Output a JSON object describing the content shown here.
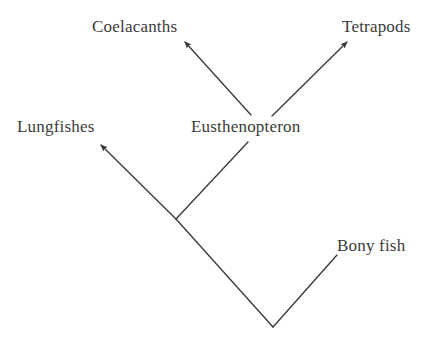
{
  "diagram": {
    "type": "cladogram",
    "background_color": "#ffffff",
    "line_color": "#3a3a3a",
    "text_color": "#3b3b3b",
    "labels": {
      "coelacanths": "Coelacanths",
      "tetrapods": "Tetrapods",
      "lungfishes": "Lungfishes",
      "eusthenopteron": "Eusthenopteron",
      "bony_fish": "Bony fish"
    },
    "nodes": [
      {
        "id": "root",
        "x": 273,
        "y": 327,
        "label": ""
      },
      {
        "id": "inner-node",
        "x": 176,
        "y": 219,
        "label": ""
      },
      {
        "id": "eusthenopteron-node",
        "x": 248,
        "y": 142,
        "label": "Eusthenopteron"
      },
      {
        "id": "coelacanths-tip",
        "x": 180,
        "y": 37,
        "label": "Coelacanths"
      },
      {
        "id": "tetrapods-tip",
        "x": 352,
        "y": 37,
        "label": "Tetrapods"
      },
      {
        "id": "lungfishes-tip",
        "x": 96,
        "y": 140,
        "label": "Lungfishes"
      },
      {
        "id": "bonyfish-tip",
        "x": 337,
        "y": 255,
        "label": "Bony fish"
      }
    ],
    "branches": [
      {
        "id": "root-to-inner",
        "from": "root",
        "to": "inner-node",
        "arrow": false
      },
      {
        "id": "root-to-bonyfish",
        "from": "root",
        "to": "bonyfish-tip",
        "arrow": false
      },
      {
        "id": "inner-to-lungfishes",
        "from": "inner-node",
        "to": "lungfishes-tip",
        "arrow": true
      },
      {
        "id": "inner-to-eusthenopteron",
        "from": "inner-node",
        "to": "eusthenopteron-node",
        "arrow": false
      },
      {
        "id": "eusthenopteron-to-coelacanths",
        "from": "eusthenopteron-node",
        "to": "coelacanths-tip",
        "arrow": true
      },
      {
        "id": "eusthenopteron-to-tetrapods",
        "from": "eusthenopteron-node",
        "to": "tetrapods-tip",
        "arrow": true
      }
    ]
  }
}
